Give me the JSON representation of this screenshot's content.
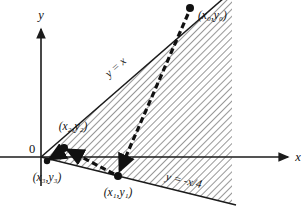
{
  "figure": {
    "background": "#ffffff",
    "ink_color": "#111111",
    "hatch_color": "#555555"
  },
  "axes": {
    "x_label": "x",
    "y_label": "y",
    "origin_label": "0",
    "origin_px": [
      41,
      157
    ],
    "x_axis_start_px": [
      0,
      157
    ],
    "x_axis_end_px": [
      292,
      157
    ],
    "y_axis_top_px": [
      41,
      25
    ],
    "y_axis_bottom_px": [
      41,
      186
    ]
  },
  "boundaries": [
    {
      "name": "upper-boundary",
      "label": "y = x",
      "equation": "y = x",
      "slope": 1,
      "label_px": [
        118,
        70
      ],
      "label_rotation_deg": -42,
      "from_px": [
        41,
        157
      ],
      "to_px": [
        232,
        -9
      ]
    },
    {
      "name": "lower-boundary",
      "label": "y = -x/4",
      "equation": "y = -x/4",
      "slope": -0.25,
      "label_px": [
        180,
        182
      ],
      "label_rotation_deg": 13,
      "from_px": [
        41,
        157
      ],
      "to_px": [
        232,
        204
      ]
    }
  ],
  "region": {
    "name": "shaded-cone",
    "hatch_style": "diagonal-lines",
    "hatch_angle_deg": 45,
    "right_edge_x_px": 232
  },
  "points": [
    {
      "id": "p0",
      "label": "(x₀,y₀)",
      "base": "x",
      "sub": "0",
      "px": [
        190,
        8
      ],
      "label_px": [
        198,
        18
      ],
      "label_anchor": "start"
    },
    {
      "id": "p1",
      "label": "(x₁,y₁)",
      "base": "x",
      "sub": "1",
      "px": [
        118,
        176
      ],
      "label_px": [
        118,
        195
      ],
      "label_anchor": "middle"
    },
    {
      "id": "p2",
      "label": "(x₂,y₂)",
      "base": "x",
      "sub": "2",
      "px": [
        64,
        148
      ],
      "label_px": [
        72,
        129
      ],
      "label_anchor": "middle"
    },
    {
      "id": "p3",
      "label": "(x₃,y₃)",
      "base": "x",
      "sub": "3",
      "px": [
        47,
        161
      ],
      "label_px": [
        48,
        180
      ],
      "label_anchor": "middle"
    }
  ],
  "iteration_path": {
    "name": "cobweb-iteration-arrows",
    "description": "dashed arrowed polyline from (x0,y0) toward the origin",
    "sequence": [
      "(x₀,y₀)",
      "(x₁,y₁)",
      "(x₂,y₂)",
      "(x₃,y₃)"
    ],
    "vertices_px": [
      [
        190,
        8
      ],
      [
        118,
        176
      ],
      [
        64,
        148
      ],
      [
        47,
        161
      ]
    ]
  }
}
